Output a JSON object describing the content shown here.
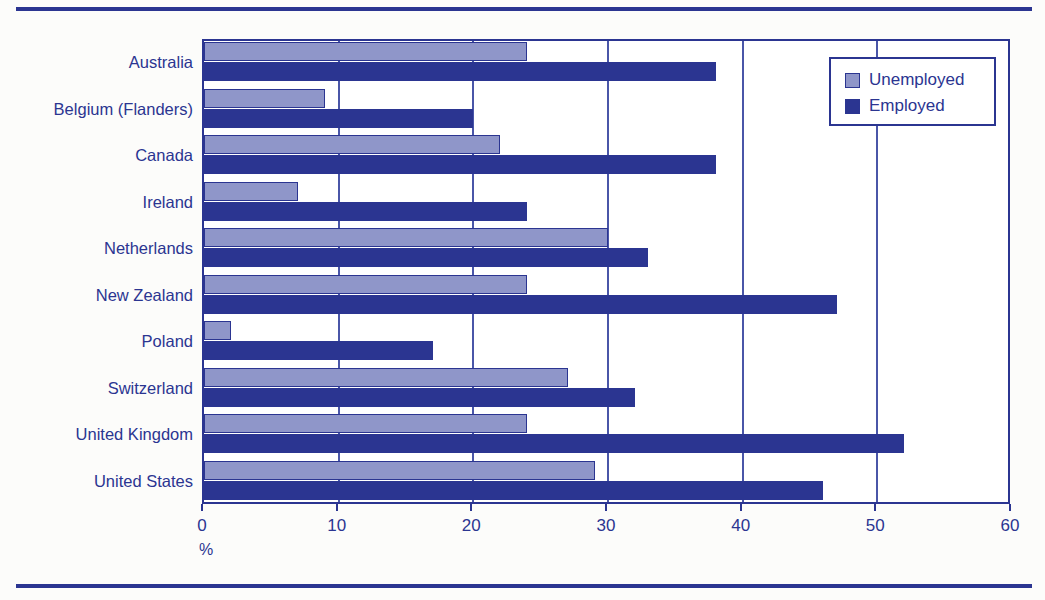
{
  "chart_data": {
    "type": "bar",
    "orientation": "horizontal",
    "title": "",
    "xlabel": "%",
    "ylabel": "",
    "xlim": [
      0,
      60
    ],
    "xticks": [
      0,
      10,
      20,
      30,
      40,
      50,
      60
    ],
    "xtick_labels": [
      "0",
      "10",
      "20",
      "30",
      "40",
      "50",
      "60"
    ],
    "grid": true,
    "grid_axis": "x",
    "legend_position": "top-right",
    "categories": [
      "Australia",
      "Belgium (Flanders)",
      "Canada",
      "Ireland",
      "Netherlands",
      "New Zealand",
      "Poland",
      "Switzerland",
      "United Kingdom",
      "United States"
    ],
    "series": [
      {
        "name": "Unemployed",
        "color": "#8f96c9",
        "values": [
          24,
          9,
          22,
          7,
          30,
          24,
          2,
          27,
          24,
          29
        ]
      },
      {
        "name": "Employed",
        "color": "#2b3591",
        "values": [
          38,
          20,
          38,
          24,
          33,
          47,
          17,
          32,
          52,
          46
        ]
      }
    ]
  },
  "legend": {
    "items": [
      {
        "label": "Unemployed",
        "swatch": "unemployed"
      },
      {
        "label": "Employed",
        "swatch": "employed"
      }
    ]
  },
  "axis": {
    "unit": "%"
  },
  "colors": {
    "accent": "#2b3591",
    "light_bar": "#8f96c9",
    "dark_bar": "#2b3591",
    "gridline": "#4a56a8",
    "page_background": "#fcfcfa"
  }
}
